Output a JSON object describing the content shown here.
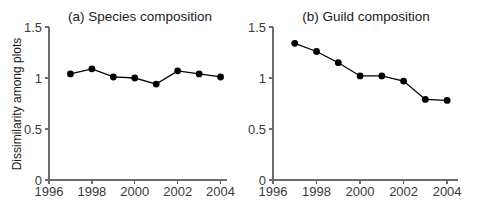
{
  "figure": {
    "y_axis_title": "Dissimilarity among plots"
  },
  "chart_data": [
    {
      "type": "line",
      "title": "(a) Species composition",
      "panel_label": "(a)",
      "xlabel": "",
      "ylabel": "Dissimilarity among plots",
      "x": [
        1997,
        1998,
        1999,
        2000,
        2001,
        2002,
        2003,
        2004
      ],
      "values": [
        1.04,
        1.09,
        1.01,
        1.0,
        0.94,
        1.07,
        1.04,
        1.01
      ],
      "xlim": [
        1996,
        2004.3
      ],
      "ylim": [
        0,
        1.5
      ],
      "xticks": [
        1996,
        1998,
        2000,
        2002,
        2004
      ],
      "xticklabels": [
        "1996",
        "1998",
        "2000",
        "2002",
        "2004"
      ],
      "yticks": [
        0,
        0.5,
        1,
        1.5
      ],
      "yticklabels": [
        "0",
        "0.5",
        "1",
        "1.5"
      ],
      "grid": false,
      "legend": "none",
      "marker": "filled-circle",
      "line_color": "#000000",
      "marker_color": "#000000"
    },
    {
      "type": "line",
      "title": "(b) Guild composition",
      "panel_label": "(b)",
      "xlabel": "",
      "ylabel": "",
      "x": [
        1997,
        1998,
        1999,
        2000,
        2001,
        2002,
        2003,
        2004
      ],
      "values": [
        1.34,
        1.26,
        1.15,
        1.02,
        1.02,
        0.97,
        0.79,
        0.78
      ],
      "xlim": [
        1996,
        2004.5
      ],
      "ylim": [
        0,
        1.5
      ],
      "xticks": [
        1996,
        1998,
        2000,
        2002,
        2004
      ],
      "xticklabels": [
        "1996",
        "1998",
        "2000",
        "2002",
        "2004"
      ],
      "yticks": [
        0,
        0.5,
        1,
        1.5
      ],
      "yticklabels": [
        "0",
        "0.5",
        "1",
        "1.5"
      ],
      "grid": false,
      "legend": "none",
      "marker": "filled-circle",
      "line_color": "#000000",
      "marker_color": "#000000"
    }
  ]
}
